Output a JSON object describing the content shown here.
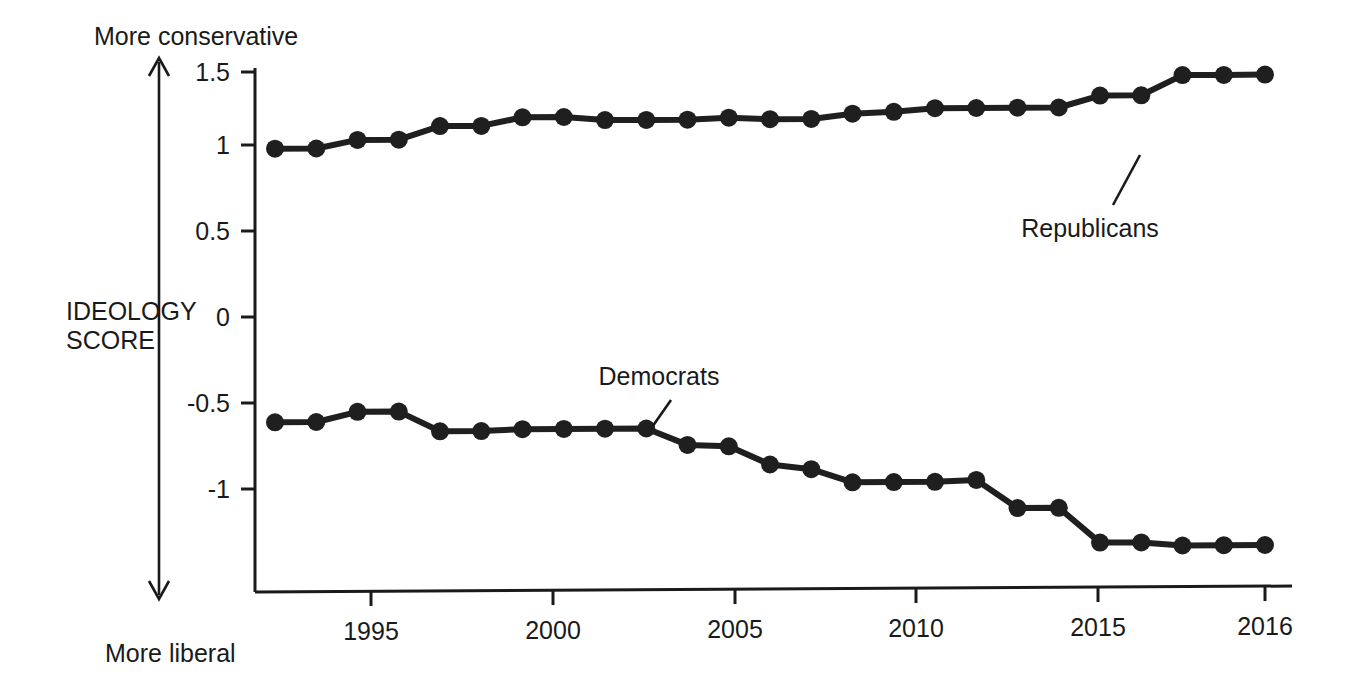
{
  "chart_data": {
    "type": "line",
    "title": "",
    "subtitle": "",
    "xlabel": "",
    "ylabel": "IDEOLOGY SCORE",
    "x": [
      1992,
      1993,
      1994,
      1995,
      1996,
      1997,
      1998,
      1999,
      2000,
      2001,
      2002,
      2003,
      2004,
      2005,
      2006,
      2007,
      2008,
      2009,
      2010,
      2011,
      2012,
      2013,
      2014,
      2015,
      2016
    ],
    "xlim": [
      1992,
      2016
    ],
    "ylim": [
      -1.5,
      1.55
    ],
    "yticks": [
      1.5,
      1,
      0.5,
      0,
      -0.5,
      -1
    ],
    "ytick_labels": [
      "1.5",
      "1",
      "0.5",
      "0",
      "-0.5",
      "-1"
    ],
    "xticks": [
      1995,
      2000,
      2005,
      2010,
      2015,
      2016
    ],
    "xtick_labels": [
      "1995",
      "2000",
      "2005",
      "2010",
      "2015",
      "2016"
    ],
    "grid": false,
    "legend_position": "inline-annotations",
    "axis_top_label": "More conservative",
    "axis_bottom_label": "More liberal",
    "series": [
      {
        "name": "Republicans",
        "color": "#1f1f1f",
        "values": [
          1.04,
          1.04,
          1.09,
          1.09,
          1.17,
          1.17,
          1.22,
          1.22,
          1.2,
          1.2,
          1.2,
          1.21,
          1.2,
          1.2,
          1.23,
          1.24,
          1.26,
          1.26,
          1.26,
          1.26,
          1.33,
          1.33,
          1.45,
          1.45,
          1.45
        ]
      },
      {
        "name": "Democrats",
        "color": "#1f1f1f",
        "values": [
          -0.6,
          -0.6,
          -0.54,
          -0.54,
          -0.66,
          -0.66,
          -0.65,
          -0.65,
          -0.65,
          -0.65,
          -0.75,
          -0.76,
          -0.87,
          -0.9,
          -0.98,
          -0.98,
          -0.98,
          -0.97,
          -1.14,
          -1.14,
          -1.35,
          -1.35,
          -1.37,
          -1.37,
          -1.37
        ]
      }
    ]
  },
  "annotations": {
    "republicans_label": "Republicans",
    "democrats_label": "Democrats"
  },
  "axis": {
    "y_axis_name_line1": "IDEOLOGY",
    "y_axis_name_line2": "SCORE",
    "top_direction": "More conservative",
    "bottom_direction": "More liberal"
  }
}
